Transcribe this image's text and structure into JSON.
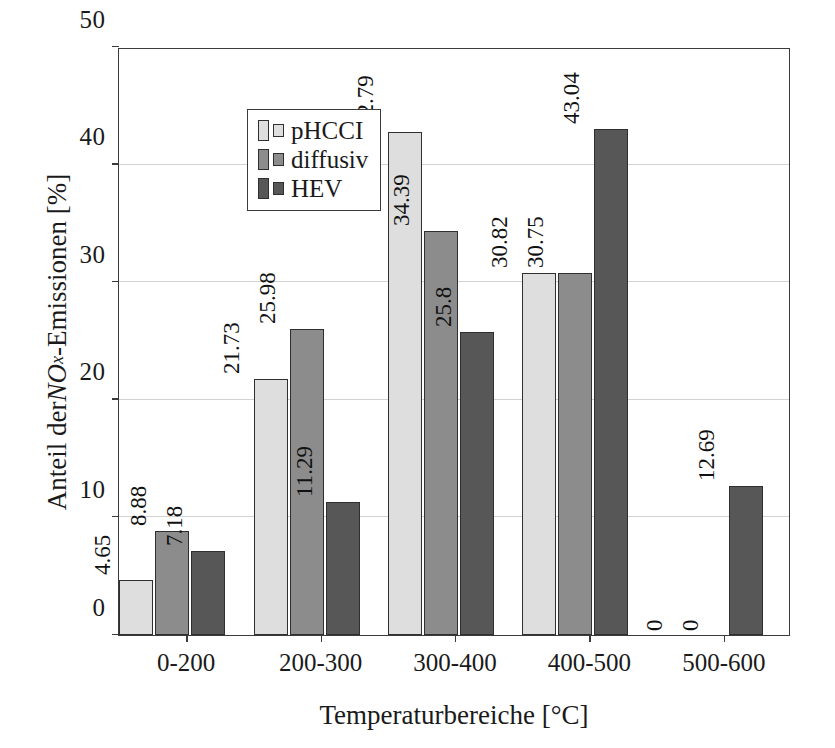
{
  "chart_data": {
    "type": "bar",
    "title": "",
    "xlabel": "Temperaturbereiche [°C]",
    "ylabel": "Anteil der NOx-Emissionen [%]",
    "ylabel_parts": {
      "prefix": "Anteil der ",
      "math_base": "NO",
      "math_sub": "x",
      "suffix": "-Emissionen [%]"
    },
    "categories": [
      "0-200",
      "200-300",
      "300-400",
      "400-500",
      "500-600"
    ],
    "series": [
      {
        "name": "pHCCI",
        "color": "#dedede",
        "values": [
          4.65,
          21.73,
          42.79,
          30.82,
          0
        ],
        "labels": [
          "4.65",
          "21.73",
          "42.79",
          "30.82",
          "0"
        ]
      },
      {
        "name": "diffusiv",
        "color": "#8c8c8c",
        "values": [
          8.88,
          25.98,
          34.39,
          30.75,
          0
        ],
        "labels": [
          "8.88",
          "25.98",
          "34.39",
          "30.75",
          "0"
        ]
      },
      {
        "name": "HEV",
        "color": "#575757",
        "values": [
          7.18,
          11.29,
          25.8,
          43.04,
          12.69
        ],
        "labels": [
          "7.18",
          "11.29",
          "25.8",
          "43.04",
          "12.69"
        ]
      }
    ],
    "ylim": [
      0,
      50
    ],
    "yticks": [
      0,
      10,
      20,
      30,
      40,
      50
    ],
    "ytick_labels": [
      "0",
      "10",
      "20",
      "30",
      "40",
      "50"
    ],
    "grid": "horizontal",
    "grid_color": "#d2d2d2",
    "legend_position": "top-left",
    "axis_color": "#3b3b3b",
    "bar_edge_color": "#2f2f2f"
  }
}
